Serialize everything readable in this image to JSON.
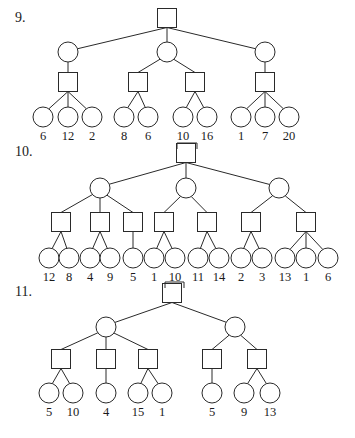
{
  "colors": {
    "ink": "#2a2a2a",
    "background": "#ffffff"
  },
  "node_size": {
    "square": 19,
    "circle_radius": 10
  },
  "trees": [
    {
      "number": "9.",
      "number_pos": [
        15,
        22
      ],
      "nodes": [
        {
          "id": "r",
          "type": "square",
          "x": 167,
          "y": 18
        },
        {
          "id": "a",
          "type": "circle",
          "x": 68,
          "y": 52,
          "parent": "r"
        },
        {
          "id": "b",
          "type": "circle",
          "x": 167,
          "y": 52,
          "parent": "r"
        },
        {
          "id": "c",
          "type": "circle",
          "x": 265,
          "y": 52,
          "parent": "r"
        },
        {
          "id": "a1",
          "type": "square",
          "x": 68,
          "y": 82,
          "parent": "a"
        },
        {
          "id": "b1",
          "type": "square",
          "x": 138,
          "y": 82,
          "parent": "b"
        },
        {
          "id": "b2",
          "type": "square",
          "x": 195,
          "y": 82,
          "parent": "b"
        },
        {
          "id": "c1",
          "type": "square",
          "x": 265,
          "y": 82,
          "parent": "c"
        },
        {
          "id": "l1",
          "type": "circle",
          "x": 43,
          "y": 117,
          "parent": "a1",
          "label": "6"
        },
        {
          "id": "l2",
          "type": "circle",
          "x": 68,
          "y": 117,
          "parent": "a1",
          "label": "12"
        },
        {
          "id": "l3",
          "type": "circle",
          "x": 92,
          "y": 117,
          "parent": "a1",
          "label": "2"
        },
        {
          "id": "l4",
          "type": "circle",
          "x": 124,
          "y": 117,
          "parent": "b1",
          "label": "8"
        },
        {
          "id": "l5",
          "type": "circle",
          "x": 148,
          "y": 117,
          "parent": "b1",
          "label": "6"
        },
        {
          "id": "l6",
          "type": "circle",
          "x": 183,
          "y": 117,
          "parent": "b2",
          "label": "10"
        },
        {
          "id": "l7",
          "type": "circle",
          "x": 207,
          "y": 117,
          "parent": "b2",
          "label": "16"
        },
        {
          "id": "l8",
          "type": "circle",
          "x": 241,
          "y": 117,
          "parent": "c1",
          "label": "1"
        },
        {
          "id": "l9",
          "type": "circle",
          "x": 265,
          "y": 117,
          "parent": "c1",
          "label": "7"
        },
        {
          "id": "l10",
          "type": "circle",
          "x": 289,
          "y": 117,
          "parent": "c1",
          "label": "20"
        }
      ],
      "label_y": 140,
      "leaf_values": [
        "6",
        "12",
        "2",
        "8",
        "6",
        "10",
        "16",
        "1",
        "7",
        "20"
      ]
    },
    {
      "number": "10.",
      "number_pos": [
        15,
        156
      ],
      "nodes": [
        {
          "id": "r",
          "type": "square",
          "x": 186,
          "y": 153
        },
        {
          "id": "a",
          "type": "circle",
          "x": 100,
          "y": 188,
          "parent": "r"
        },
        {
          "id": "b",
          "type": "circle",
          "x": 186,
          "y": 188,
          "parent": "r"
        },
        {
          "id": "c",
          "type": "circle",
          "x": 279,
          "y": 188,
          "parent": "r"
        },
        {
          "id": "s1",
          "type": "square",
          "x": 61,
          "y": 222,
          "parent": "a"
        },
        {
          "id": "s2",
          "type": "square",
          "x": 100,
          "y": 222,
          "parent": "a"
        },
        {
          "id": "s3",
          "type": "square",
          "x": 133,
          "y": 222,
          "parent": "a"
        },
        {
          "id": "s4",
          "type": "square",
          "x": 164,
          "y": 222,
          "parent": "b"
        },
        {
          "id": "s5",
          "type": "square",
          "x": 207,
          "y": 222,
          "parent": "b"
        },
        {
          "id": "s6",
          "type": "square",
          "x": 251,
          "y": 222,
          "parent": "c"
        },
        {
          "id": "s7",
          "type": "square",
          "x": 306,
          "y": 222,
          "parent": "c"
        },
        {
          "id": "l1",
          "type": "circle",
          "x": 49,
          "y": 258,
          "parent": "s1",
          "label": "12"
        },
        {
          "id": "l2",
          "type": "circle",
          "x": 69,
          "y": 258,
          "parent": "s1",
          "label": "8"
        },
        {
          "id": "l3",
          "type": "circle",
          "x": 90,
          "y": 258,
          "parent": "s2",
          "label": "4"
        },
        {
          "id": "l4",
          "type": "circle",
          "x": 110,
          "y": 258,
          "parent": "s2",
          "label": "9"
        },
        {
          "id": "l5",
          "type": "circle",
          "x": 133,
          "y": 258,
          "parent": "s3",
          "label": "5"
        },
        {
          "id": "l6",
          "type": "circle",
          "x": 154,
          "y": 258,
          "parent": "s4",
          "label": "1"
        },
        {
          "id": "l7",
          "type": "circle",
          "x": 175,
          "y": 258,
          "parent": "s4",
          "label": "10"
        },
        {
          "id": "l8",
          "type": "circle",
          "x": 198,
          "y": 258,
          "parent": "s5",
          "label": "11"
        },
        {
          "id": "l9",
          "type": "circle",
          "x": 219,
          "y": 258,
          "parent": "s5",
          "label": "14"
        },
        {
          "id": "l10",
          "type": "circle",
          "x": 241,
          "y": 258,
          "parent": "s6",
          "label": "2"
        },
        {
          "id": "l11",
          "type": "circle",
          "x": 262,
          "y": 258,
          "parent": "s6",
          "label": "3"
        },
        {
          "id": "l12",
          "type": "circle",
          "x": 285,
          "y": 258,
          "parent": "s7",
          "label": "13"
        },
        {
          "id": "l13",
          "type": "circle",
          "x": 306,
          "y": 258,
          "parent": "s7",
          "label": "1"
        },
        {
          "id": "l14",
          "type": "circle",
          "x": 328,
          "y": 258,
          "parent": "s7",
          "label": "6"
        }
      ],
      "label_y": 281,
      "leaf_values": [
        "12",
        "8",
        "4",
        "9",
        "5",
        "1",
        "10",
        "11",
        "14",
        "2",
        "3",
        "13",
        "1",
        "6"
      ]
    },
    {
      "number": "11.",
      "number_pos": [
        15,
        296
      ],
      "nodes": [
        {
          "id": "r",
          "type": "square",
          "x": 172,
          "y": 293
        },
        {
          "id": "a",
          "type": "circle",
          "x": 106,
          "y": 327,
          "parent": "r"
        },
        {
          "id": "b",
          "type": "circle",
          "x": 235,
          "y": 327,
          "parent": "r"
        },
        {
          "id": "s1",
          "type": "square",
          "x": 61,
          "y": 359,
          "parent": "a"
        },
        {
          "id": "s2",
          "type": "square",
          "x": 106,
          "y": 359,
          "parent": "a"
        },
        {
          "id": "s3",
          "type": "square",
          "x": 148,
          "y": 359,
          "parent": "a"
        },
        {
          "id": "s4",
          "type": "square",
          "x": 212,
          "y": 359,
          "parent": "b"
        },
        {
          "id": "s5",
          "type": "square",
          "x": 257,
          "y": 359,
          "parent": "b"
        },
        {
          "id": "l1",
          "type": "circle",
          "x": 49,
          "y": 393,
          "parent": "s1",
          "label": "5"
        },
        {
          "id": "l2",
          "type": "circle",
          "x": 73,
          "y": 393,
          "parent": "s1",
          "label": "10"
        },
        {
          "id": "l3",
          "type": "circle",
          "x": 106,
          "y": 393,
          "parent": "s2",
          "label": "4"
        },
        {
          "id": "l4",
          "type": "circle",
          "x": 138,
          "y": 393,
          "parent": "s3",
          "label": "15"
        },
        {
          "id": "l5",
          "type": "circle",
          "x": 162,
          "y": 393,
          "parent": "s3",
          "label": "1"
        },
        {
          "id": "l6",
          "type": "circle",
          "x": 212,
          "y": 393,
          "parent": "s4",
          "label": "5"
        },
        {
          "id": "l7",
          "type": "circle",
          "x": 244,
          "y": 393,
          "parent": "s5",
          "label": "9"
        },
        {
          "id": "l8",
          "type": "circle",
          "x": 270,
          "y": 393,
          "parent": "s5",
          "label": "13"
        }
      ],
      "label_y": 416,
      "leaf_values": [
        "5",
        "10",
        "4",
        "15",
        "1",
        "5",
        "9",
        "13"
      ]
    }
  ],
  "artifacts": [
    {
      "x": 177,
      "y": 143,
      "w": 20,
      "h": 6
    },
    {
      "x": 165,
      "y": 282,
      "w": 19,
      "h": 6
    }
  ]
}
